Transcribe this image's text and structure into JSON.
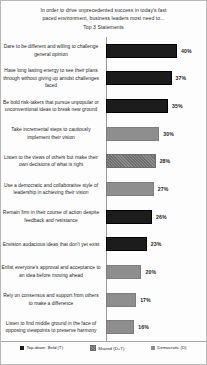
{
  "chart_data": {
    "type": "bar",
    "orientation": "horizontal",
    "title": "In order to drive unprecedented success in today's fast paced environment, business leaders most need to...",
    "subtitle": "Top 3 Statements",
    "title_lines": [
      "In order to drive unprecedented success in today's fast",
      "paced environment, business leaders most need to..."
    ],
    "xlabel": "",
    "ylabel": "",
    "grid": false,
    "legend_position": "bottom",
    "xlim": [
      0,
      44
    ],
    "categories": [
      "Dare to be different and willing to challenge  general opinion",
      "Have long lasting energy to see their plans through without giving up amidst challenges faced",
      "Be bold risk-takers  that pursue unpopular or unconventional ideas to break new ground",
      "Take incremental steps to cautiously implement their vision",
      "Listen to the views of others but make their own decisions of what is right",
      "Use a democratic and collaborative style of leadership  in achieving their vision",
      "Remain firm in their course of action despite feedback and resistance",
      "Envision audacious ideas that don't yet exist",
      "Enlist everyone's approval and acceptance to an idea before moving ahead",
      "Rely on consensus and support from others to make a difference",
      "Listen to find middle ground in the face of opposing viewpoints  to preserve harmony"
    ],
    "values": [
      40,
      37,
      35,
      30,
      28,
      27,
      26,
      23,
      20,
      17,
      16
    ],
    "value_labels": [
      "40%",
      "37%",
      "35%",
      "30%",
      "28%",
      "27%",
      "26%",
      "23%",
      "20%",
      "17%",
      "16%"
    ],
    "series_key": [
      "topdown",
      "topdown",
      "topdown",
      "democratic",
      "shared",
      "democratic",
      "topdown",
      "topdown",
      "democratic",
      "democratic",
      "democratic"
    ],
    "legend": [
      {
        "key": "topdown",
        "label": "Top-down: Bold (T)",
        "color": "#1c1c1c"
      },
      {
        "key": "shared",
        "label": "Shared (D+T)",
        "color": "#8c8c8c"
      },
      {
        "key": "democratic",
        "label": "Democratic (D)",
        "color": "#8e8e8e"
      }
    ]
  }
}
